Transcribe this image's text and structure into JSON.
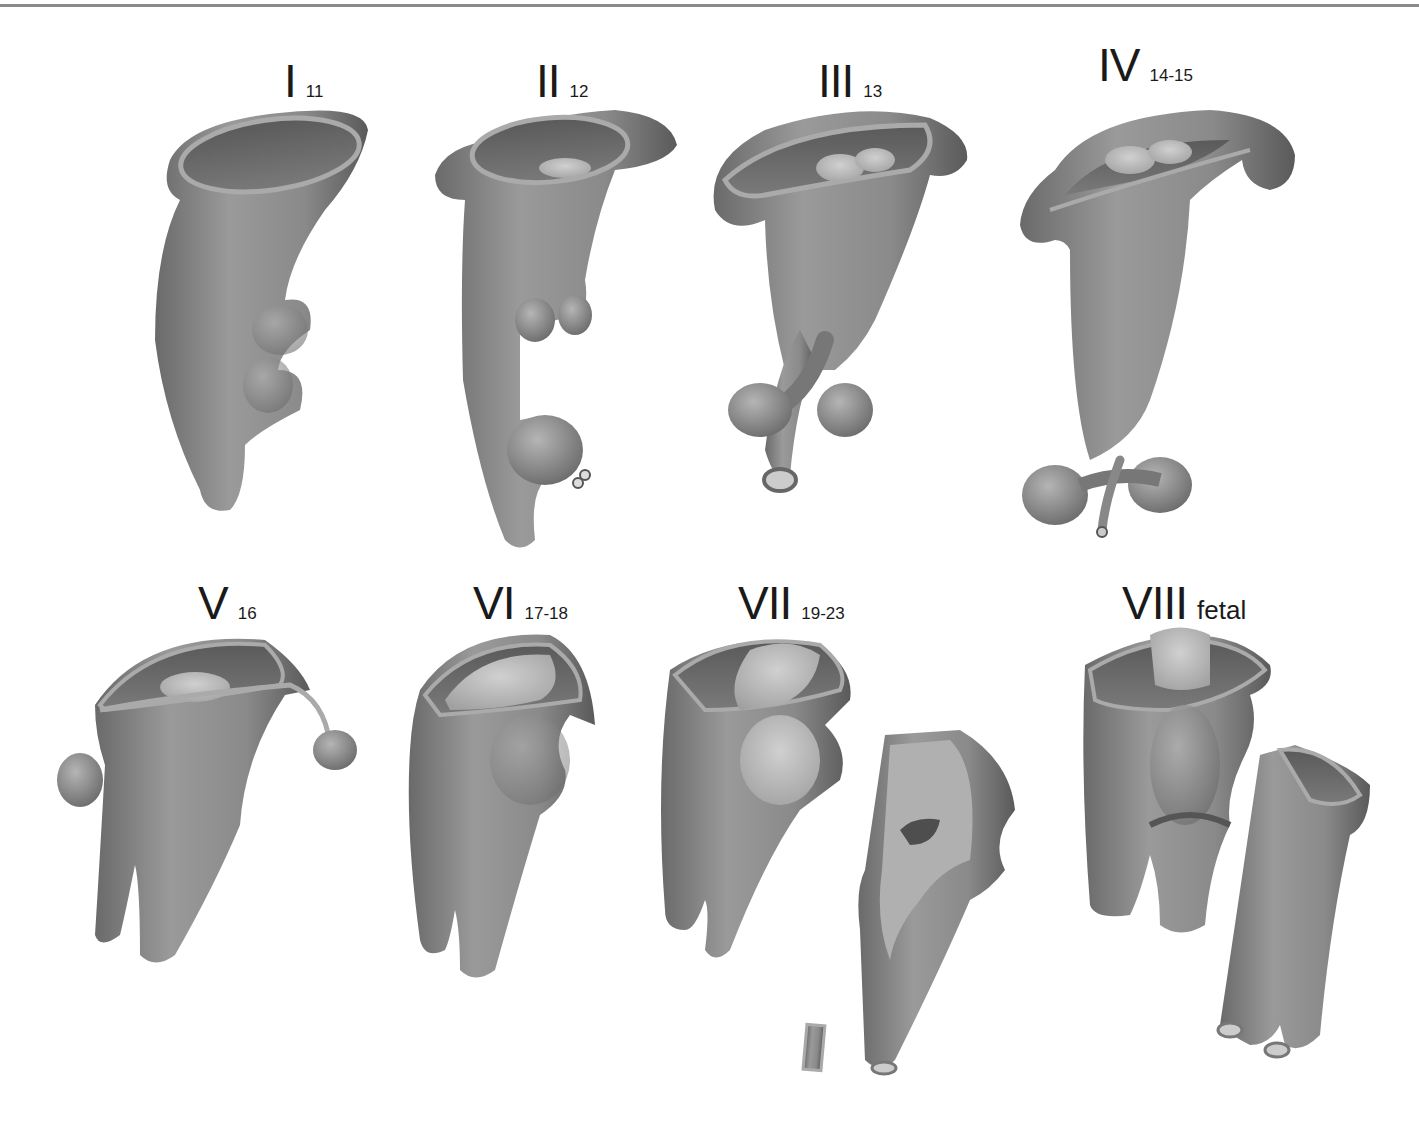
{
  "figure": {
    "colors": {
      "tissue_dark": "#5e5e5e",
      "tissue_mid": "#8c8c8c",
      "tissue_light": "#bdbdbd",
      "rim": "#a9a9a9",
      "rule": "#8a8a8a"
    },
    "stages": [
      {
        "numeral": "I",
        "age": "11"
      },
      {
        "numeral": "II",
        "age": "12"
      },
      {
        "numeral": "III",
        "age": "13"
      },
      {
        "numeral": "IV",
        "age": "14-15"
      },
      {
        "numeral": "V",
        "age": "16"
      },
      {
        "numeral": "VI",
        "age": "17-18"
      },
      {
        "numeral": "VII",
        "age": "19-23"
      },
      {
        "numeral": "VIII",
        "age": "fetal"
      }
    ]
  }
}
